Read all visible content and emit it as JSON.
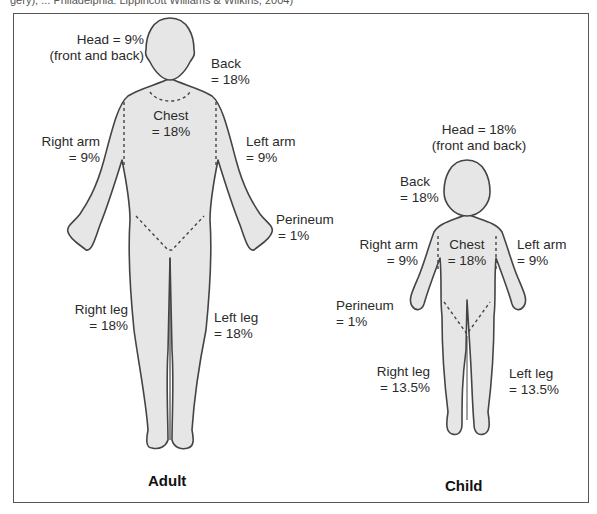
{
  "source_caption": "gery), ... Philadelphia: Lippincott Williams & Wilkins, 2004)",
  "colors": {
    "body_fill": "#e6e6e6",
    "outline": "#444444",
    "frame": "#555555"
  },
  "adult": {
    "title": "Adult",
    "head": [
      "Head = 9%",
      "(front and back)"
    ],
    "back": [
      "Back",
      "= 18%"
    ],
    "chest": [
      "Chest",
      "= 18%"
    ],
    "right_arm": [
      "Right arm",
      "= 9%"
    ],
    "left_arm": [
      "Left arm",
      "= 9%"
    ],
    "perineum": [
      "Perineum",
      "= 1%"
    ],
    "right_leg": [
      "Right leg",
      "= 18%"
    ],
    "left_leg": [
      "Left leg",
      "= 18%"
    ]
  },
  "child": {
    "title": "Child",
    "head": [
      "Head = 18%",
      "(front and back)"
    ],
    "back": [
      "Back",
      "= 18%"
    ],
    "chest": [
      "Chest",
      "= 18%"
    ],
    "right_arm": [
      "Right arm",
      "= 9%"
    ],
    "left_arm": [
      "Left arm",
      "= 9%"
    ],
    "perineum": [
      "Perineum",
      "= 1%"
    ],
    "right_leg": [
      "Right leg",
      "= 13.5%"
    ],
    "left_leg": [
      "Left leg",
      "= 13.5%"
    ]
  }
}
